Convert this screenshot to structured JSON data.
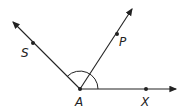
{
  "diagram": {
    "type": "angle-figure",
    "vertex": {
      "label": "A"
    },
    "points": [
      {
        "label": "S"
      },
      {
        "label": "P"
      },
      {
        "label": "X"
      }
    ],
    "rays": [
      "AS",
      "AP",
      "AX"
    ],
    "arc": "angle SAX marked"
  }
}
